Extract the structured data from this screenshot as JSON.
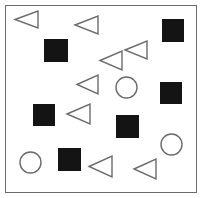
{
  "canvas": {
    "width": 202,
    "height": 198,
    "background": "#ffffff",
    "description": "Abstract shape-counting stimulus: filled black squares, outlined left-pointing triangles and outlined circles scattered inside a thin rectangular frame."
  },
  "frame": {
    "name": "bounding-frame",
    "x": 5,
    "y": 5,
    "width": 192,
    "height": 188,
    "stroke": "#6b6b6b",
    "stroke_width": 1.5,
    "fill": "#ffffff"
  },
  "style": {
    "square_fill": "#141414",
    "square_stroke": "#141414",
    "outline_stroke": "#6b6b6b",
    "outline_fill": "none",
    "outline_stroke_width": 1.4
  },
  "counts": {
    "squares": 7,
    "triangles": 8,
    "circles": 3,
    "total": 18
  },
  "shapes": [
    {
      "id": 1,
      "type": "triangle",
      "direction": "left",
      "x": 14,
      "y": 10,
      "width": 25,
      "height": 19
    },
    {
      "id": 2,
      "type": "triangle",
      "direction": "left",
      "x": 74,
      "y": 15,
      "width": 25,
      "height": 20
    },
    {
      "id": 3,
      "type": "square",
      "direction": "",
      "x": 162,
      "y": 19,
      "width": 22,
      "height": 23
    },
    {
      "id": 4,
      "type": "square",
      "direction": "",
      "x": 44,
      "y": 39,
      "width": 24,
      "height": 23
    },
    {
      "id": 5,
      "type": "triangle",
      "direction": "left",
      "x": 124,
      "y": 40,
      "width": 24,
      "height": 20
    },
    {
      "id": 6,
      "type": "triangle",
      "direction": "left",
      "x": 99,
      "y": 50,
      "width": 24,
      "height": 21
    },
    {
      "id": 7,
      "type": "triangle",
      "direction": "left",
      "x": 76,
      "y": 74,
      "width": 23,
      "height": 21
    },
    {
      "id": 8,
      "type": "circle",
      "direction": "",
      "x": 115,
      "y": 76,
      "width": 23,
      "height": 23
    },
    {
      "id": 9,
      "type": "square",
      "direction": "",
      "x": 160,
      "y": 82,
      "width": 22,
      "height": 22
    },
    {
      "id": 10,
      "type": "square",
      "direction": "",
      "x": 33,
      "y": 104,
      "width": 22,
      "height": 22
    },
    {
      "id": 11,
      "type": "triangle",
      "direction": "left",
      "x": 66,
      "y": 103,
      "width": 25,
      "height": 22
    },
    {
      "id": 12,
      "type": "square",
      "direction": "",
      "x": 116,
      "y": 115,
      "width": 23,
      "height": 23
    },
    {
      "id": 13,
      "type": "circle",
      "direction": "",
      "x": 160,
      "y": 133,
      "width": 23,
      "height": 23
    },
    {
      "id": 14,
      "type": "square",
      "direction": "",
      "x": 58,
      "y": 148,
      "width": 23,
      "height": 23
    },
    {
      "id": 15,
      "type": "circle",
      "direction": "",
      "x": 19,
      "y": 151,
      "width": 23,
      "height": 23
    },
    {
      "id": 16,
      "type": "triangle",
      "direction": "left",
      "x": 88,
      "y": 155,
      "width": 25,
      "height": 23
    },
    {
      "id": 17,
      "type": "triangle",
      "direction": "left",
      "x": 133,
      "y": 158,
      "width": 24,
      "height": 22
    }
  ]
}
